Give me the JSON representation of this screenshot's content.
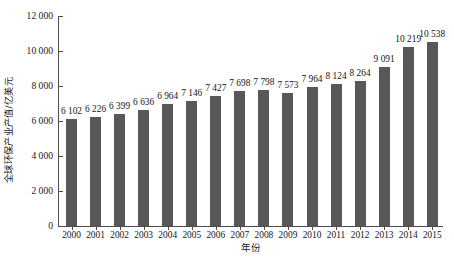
{
  "chart_data": {
    "type": "bar",
    "title": "",
    "xlabel": "年份",
    "ylabel": "全球环保产业产值/亿美元",
    "categories": [
      "2000",
      "2001",
      "2002",
      "2003",
      "2004",
      "2005",
      "2006",
      "2007",
      "2008",
      "2009",
      "2010",
      "2011",
      "2012",
      "2013",
      "2014",
      "2015"
    ],
    "values": [
      6102,
      6226,
      6399,
      6636,
      6964,
      7146,
      7427,
      7698,
      7798,
      7573,
      7964,
      8124,
      8264,
      9091,
      10219,
      10538
    ],
    "value_labels": [
      "6 102",
      "6 226",
      "6 399",
      "6 636",
      "6 964",
      "7 146",
      "7 427",
      "7 698",
      "7 798",
      "7 573",
      "7 964",
      "8 124",
      "8 264",
      "9 091",
      "10 219",
      "10 538"
    ],
    "ylim": [
      0,
      12000
    ],
    "ytick_values": [
      0,
      2000,
      4000,
      6000,
      8000,
      10000,
      12000
    ],
    "ytick_labels": [
      "0",
      "2 000",
      "4 000",
      "6 000",
      "8 000",
      "10 000",
      "12 000"
    ],
    "grid": false,
    "legend": null,
    "bar_color": "#585858",
    "axis_color": "#4d4d4d",
    "background_color": "#ffffff",
    "data_labels_shown": true
  },
  "axes": {
    "y_title": "全球环保产业产值/亿美元",
    "x_title": "年份"
  }
}
